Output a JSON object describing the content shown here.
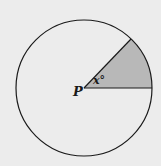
{
  "diagram": {
    "type": "circle-sector",
    "center_label": "P",
    "angle_label": "x°",
    "center": [
      84,
      88
    ],
    "radius": 68,
    "sector_start_point": [
      152,
      88
    ],
    "sector_end_point": [
      131,
      39
    ],
    "colors": {
      "background": "#ececec",
      "stroke": "#1a1a1a",
      "sector_fill": "#b8b8b8"
    }
  }
}
